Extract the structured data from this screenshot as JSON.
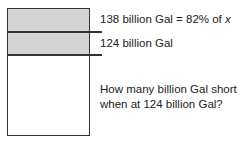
{
  "diagram": {
    "bar": {
      "segments": [
        {
          "name": "top",
          "shaded": true,
          "color": "#d4d4d4"
        },
        {
          "name": "middle",
          "shaded": true,
          "color": "#d4d4d4"
        },
        {
          "name": "bottom",
          "shaded": false,
          "color": "#ffffff"
        }
      ]
    },
    "labels": {
      "line1_main": "138 billion Gal = 82% of ",
      "line1_var": "x",
      "line2": "124 billion Gal"
    },
    "question": {
      "line1": "How many billion Gal short",
      "line2": "when at 124 billion Gal?"
    }
  }
}
